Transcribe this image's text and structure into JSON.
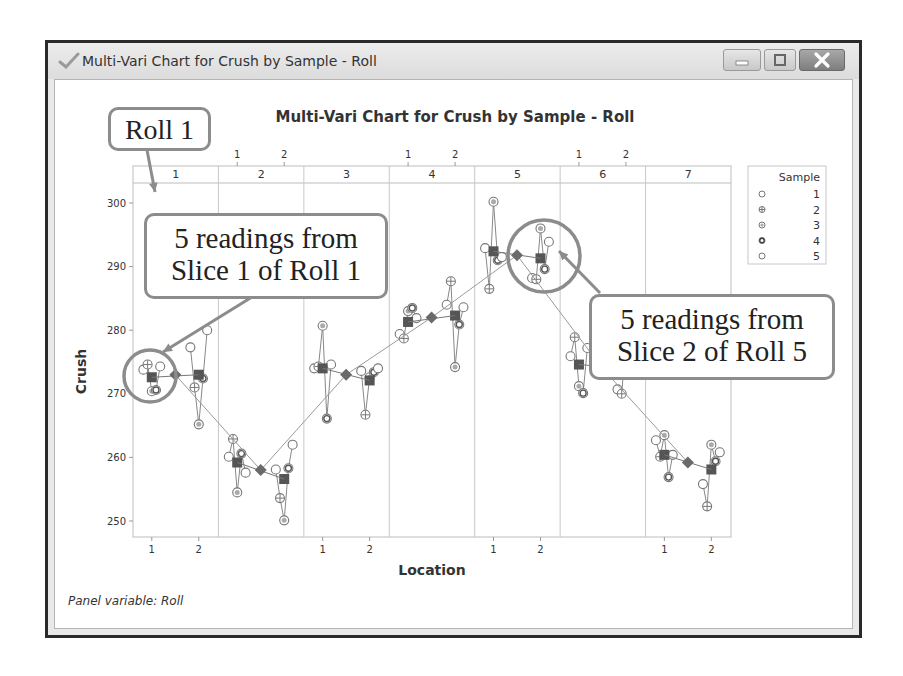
{
  "window": {
    "title": "Multi-Vari Chart for Crush by Sample - Roll",
    "buttons": [
      "minimize",
      "maximize",
      "close"
    ]
  },
  "annotations": {
    "roll_label": "Roll 1",
    "callout_left": [
      "5 readings from",
      "Slice 1 of Roll 1"
    ],
    "callout_right": [
      "5 readings from",
      "Slice 2 of Roll 5"
    ]
  },
  "footer": {
    "panel_variable": "Panel variable: Roll"
  },
  "colors": {
    "callout_border": "#8c8c8c",
    "marker": "#777777",
    "mean_square": "#555555",
    "mean_diamond": "#6a6a6a",
    "grid": "#cfcfcf"
  },
  "chart_data": {
    "type": "multi-vari",
    "title": "Multi-Vari Chart for Crush by Sample - Roll",
    "xlabel": "Location",
    "ylabel": "Crush",
    "ylim": [
      247,
      303
    ],
    "yticks": [
      250,
      260,
      270,
      280,
      290,
      300
    ],
    "panel_variable": "Roll",
    "panels": [
      "1",
      "2",
      "3",
      "4",
      "5",
      "6",
      "7"
    ],
    "x_categories": [
      "1",
      "2"
    ],
    "legend": {
      "title": "Sample",
      "entries": [
        "1",
        "2",
        "3",
        "4",
        "5"
      ]
    },
    "rolls": [
      {
        "roll": "1",
        "mean": 273.0,
        "locations": [
          {
            "loc": "1",
            "mean": 272.6,
            "samples": [
              273.8,
              274.6,
              270.4,
              270.6,
              274.3
            ]
          },
          {
            "loc": "2",
            "mean": 273.0,
            "samples": [
              277.3,
              271.0,
              265.2,
              272.4,
              280.0
            ]
          }
        ]
      },
      {
        "roll": "2",
        "mean": 258.0,
        "locations": [
          {
            "loc": "1",
            "mean": 259.2,
            "samples": [
              260.1,
              262.9,
              254.5,
              260.6,
              257.6
            ]
          },
          {
            "loc": "2",
            "mean": 256.6,
            "samples": [
              258.1,
              253.6,
              250.1,
              258.3,
              262.0
            ]
          }
        ]
      },
      {
        "roll": "3",
        "mean": 273.0,
        "locations": [
          {
            "loc": "1",
            "mean": 274.0,
            "samples": [
              274.0,
              274.3,
              280.7,
              266.1,
              274.6
            ]
          },
          {
            "loc": "2",
            "mean": 272.1,
            "samples": [
              273.6,
              266.7,
              272.6,
              273.4,
              274.0
            ]
          }
        ]
      },
      {
        "roll": "4",
        "mean": 282.0,
        "locations": [
          {
            "loc": "1",
            "mean": 281.3,
            "samples": [
              279.4,
              278.7,
              283.0,
              283.5,
              281.9
            ]
          },
          {
            "loc": "2",
            "mean": 282.3,
            "samples": [
              284.0,
              287.7,
              274.2,
              280.9,
              283.6
            ]
          }
        ]
      },
      {
        "roll": "5",
        "mean": 291.8,
        "locations": [
          {
            "loc": "1",
            "mean": 292.4,
            "samples": [
              292.9,
              286.5,
              300.2,
              291.0,
              291.5
            ]
          },
          {
            "loc": "2",
            "mean": 291.3,
            "samples": [
              288.2,
              288.0,
              296.0,
              289.6,
              293.9
            ]
          }
        ]
      },
      {
        "roll": "6",
        "mean": 274.0,
        "locations": [
          {
            "loc": "1",
            "mean": 274.6,
            "samples": [
              275.9,
              278.9,
              271.2,
              270.1,
              277.2
            ]
          },
          {
            "loc": "2",
            "mean": 274.0,
            "samples": [
              270.7,
              270.0,
              278.5,
              274.3,
              276.0
            ]
          }
        ]
      },
      {
        "roll": "7",
        "mean": 259.2,
        "locations": [
          {
            "loc": "1",
            "mean": 260.4,
            "samples": [
              262.7,
              260.1,
              263.5,
              256.9,
              260.4
            ]
          },
          {
            "loc": "2",
            "mean": 258.1,
            "samples": [
              255.8,
              252.3,
              262.0,
              259.4,
              260.8
            ]
          }
        ]
      }
    ]
  }
}
